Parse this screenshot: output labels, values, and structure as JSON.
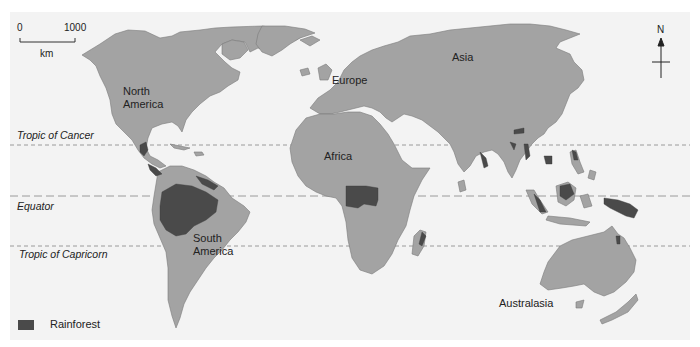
{
  "map": {
    "scale_bar": {
      "start": "0",
      "end": "1000",
      "unit": "km"
    },
    "north_arrow": {
      "label": "N"
    },
    "latitude_lines": [
      {
        "label": "Tropic of Cancer",
        "y": 145
      },
      {
        "label": "Equator",
        "y": 196
      },
      {
        "label": "Tropic of Capricorn",
        "y": 246
      }
    ],
    "continents": [
      {
        "name": "North America",
        "label": "North\nAmerica"
      },
      {
        "name": "South America",
        "label": "South\nAmerica"
      },
      {
        "name": "Europe",
        "label": "Europe"
      },
      {
        "name": "Asia",
        "label": "Asia"
      },
      {
        "name": "Africa",
        "label": "Africa"
      },
      {
        "name": "Australasia",
        "label": "Australasia"
      }
    ],
    "legend": {
      "items": [
        {
          "label": "Rainforest",
          "color": "#4a4a4a"
        }
      ]
    },
    "colors": {
      "land": "#a3a3a3",
      "rainforest": "#4a4a4a",
      "ocean": "#f3f3f3",
      "lines": "#9a9a9a"
    }
  }
}
